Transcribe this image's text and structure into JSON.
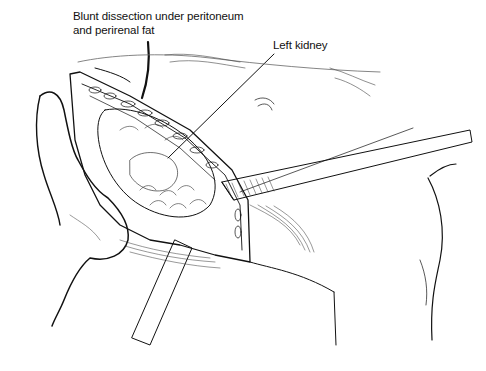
{
  "figure": {
    "labels": [
      {
        "id": "dissection",
        "lines": [
          "Blunt dissection under peritoneum",
          "and perirenal fat"
        ]
      },
      {
        "id": "kidney",
        "lines": [
          "Left kidney"
        ]
      }
    ],
    "colors": {
      "ink": "#111111",
      "background": "#ffffff"
    }
  }
}
